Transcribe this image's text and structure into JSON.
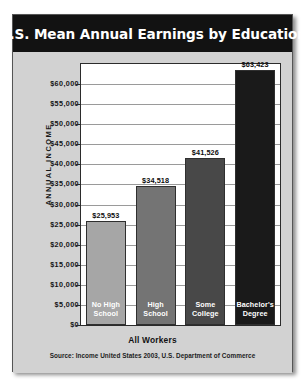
{
  "chart": {
    "title": "U.S. Mean Annual Earnings by Education",
    "y_axis_title": "ANNUAL INCOME",
    "x_axis_title": "All Workers",
    "source": "Source: Income United States 2003, U.S. Department of Commerce"
  },
  "chart_data": {
    "type": "bar",
    "title": "U.S. Mean Annual Earnings by Education",
    "xlabel": "All Workers",
    "ylabel": "ANNUAL INCOME",
    "categories": [
      "No High School",
      "High School",
      "Some College",
      "Bachelor's Degree"
    ],
    "category_lines": [
      [
        "No High",
        "School"
      ],
      [
        "High",
        "School"
      ],
      [
        "Some",
        "College"
      ],
      [
        "Bachelor's",
        "Degree"
      ]
    ],
    "values": [
      25953,
      34518,
      41526,
      63423
    ],
    "value_labels": [
      "$25,953",
      "$34,518",
      "$41,526",
      "$63,423"
    ],
    "bar_colors": [
      "#a6a6a6",
      "#747474",
      "#484848",
      "#1a1a1a"
    ],
    "ylim": [
      0,
      65000
    ],
    "ytick_values": [
      0,
      5000,
      10000,
      15000,
      20000,
      25000,
      30000,
      35000,
      40000,
      45000,
      50000,
      55000,
      60000
    ],
    "ytick_labels": [
      "$0",
      "$5,000",
      "$10,000",
      "$15,000",
      "$20,000",
      "$25,000",
      "$30,000",
      "$35,000",
      "$40,000",
      "$45,000",
      "$50,000",
      "$55,000",
      "$60,000"
    ],
    "grid": true,
    "legend": false,
    "annotation": "Source: Income United States 2003, U.S. Department of Commerce"
  }
}
